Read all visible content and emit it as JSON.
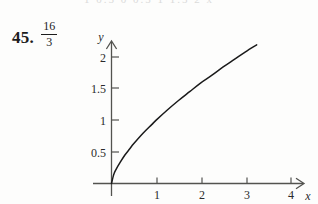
{
  "page": {
    "clipped_top_row": "1   0.5   0   0.5   1   1.5   2   x",
    "background_color": "#fdfdfc",
    "ink_color": "#1c1c1c"
  },
  "answer": {
    "exercise_number": "45.",
    "value_numerator": "16",
    "value_denominator": "3"
  },
  "chart_data": {
    "type": "line",
    "title": "",
    "xlabel": "x",
    "ylabel": "y",
    "xlim": [
      0,
      4.5
    ],
    "ylim": [
      0,
      2.25
    ],
    "grid": false,
    "legend": null,
    "x_ticks": [
      1,
      2,
      3,
      4
    ],
    "x_tick_labels": [
      "1",
      "2",
      "3",
      "4"
    ],
    "y_ticks": [
      0.5,
      1,
      1.5,
      2
    ],
    "y_tick_labels": [
      "0.5",
      "1",
      "1.5",
      "2"
    ],
    "axis_arrows": [
      "x-positive",
      "y-positive"
    ],
    "series": [
      {
        "name": "y = x^(2/3)",
        "x": [
          0,
          0.05,
          0.1,
          0.2,
          0.3,
          0.4,
          0.5,
          0.7,
          0.9,
          1.0,
          1.25,
          1.5,
          1.75,
          2.0,
          2.25,
          2.5,
          2.75,
          3.0,
          3.25,
          3.5,
          3.75,
          4.0,
          4.3
        ],
        "values": [
          0,
          0.14,
          0.22,
          0.34,
          0.45,
          0.54,
          0.63,
          0.79,
          0.93,
          1.0,
          1.16,
          1.31,
          1.45,
          1.59,
          1.71,
          1.84,
          1.96,
          2.08,
          2.19,
          2.3,
          2.41,
          2.52,
          2.63
        ]
      }
    ]
  },
  "axes_labels": {
    "y_axis_name": "y",
    "x_axis_name": "x"
  }
}
